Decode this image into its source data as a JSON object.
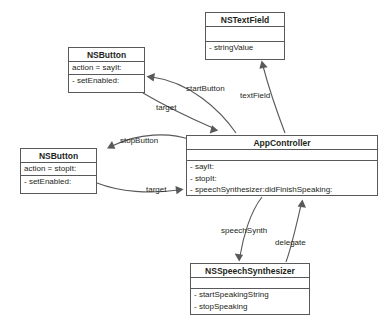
{
  "diagram": {
    "type": "uml-object-diagram",
    "background_color": "#ffffff",
    "stroke_color": "#58595b",
    "text_color": "#231f20",
    "classes": [
      {
        "id": "nstextfield",
        "name": "NSTextField",
        "attributes": [],
        "operations": [
          "- stringValue"
        ]
      },
      {
        "id": "nsbutton-start",
        "name": "NSButton",
        "attributes": [
          "action = sayIt:"
        ],
        "operations": [
          "- setEnabled:"
        ]
      },
      {
        "id": "nsbutton-stop",
        "name": "NSButton",
        "attributes": [
          "action = stopIt:"
        ],
        "operations": [
          "- setEnabled:"
        ]
      },
      {
        "id": "appcontroller",
        "name": "AppController",
        "attributes": [],
        "operations": [
          "- sayIt:",
          "- stopIt:",
          "- speechSynthesizer:didFinishSpeaking:"
        ]
      },
      {
        "id": "nsspeechsynthesizer",
        "name": "NSSpeechSynthesizer",
        "attributes": [],
        "operations": [
          "- startSpeakingString",
          "- stopSpeaking"
        ]
      }
    ],
    "edges": [
      {
        "id": "startbutton",
        "label": "startButton",
        "from": "appcontroller",
        "to": "nsbutton-start"
      },
      {
        "id": "textfield",
        "label": "textField",
        "from": "appcontroller",
        "to": "nstextfield"
      },
      {
        "id": "target-start",
        "label": "target",
        "from": "nsbutton-start",
        "to": "appcontroller"
      },
      {
        "id": "stopbutton",
        "label": "stopButton",
        "from": "appcontroller",
        "to": "nsbutton-stop"
      },
      {
        "id": "target-stop",
        "label": "target",
        "from": "nsbutton-stop",
        "to": "appcontroller"
      },
      {
        "id": "speechsynth",
        "label": "speechSynth",
        "from": "appcontroller",
        "to": "nsspeechsynthesizer"
      },
      {
        "id": "delegate",
        "label": "delegate",
        "from": "nsspeechsynthesizer",
        "to": "appcontroller"
      }
    ]
  }
}
